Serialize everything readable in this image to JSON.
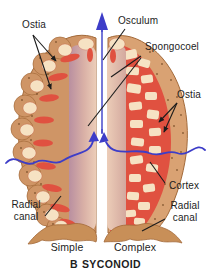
{
  "figure": {
    "labels": {
      "ostia_left": "Ostia",
      "osculum": "Osculum",
      "spongocoel": "Spongocoel",
      "ostia_right": "Ostia",
      "cortex": "Cortex",
      "radial_canal_left": "Radial canal",
      "radial_canal_right": "Radial canal",
      "simple": "Simple",
      "complex": "Complex"
    },
    "caption": {
      "letter": "B",
      "title": "SYCONOID"
    },
    "colors": {
      "tan_body": "#cf9566",
      "tan_light": "#d9a273",
      "tan_dark": "#a36a3a",
      "cream": "#f6e2c3",
      "canal_red": "#e05140",
      "red_dark": "#b93a2e",
      "inner_pink": "#e3c0af",
      "inner_mauve": "#b98fa0",
      "base_tan": "#c88f58",
      "arrow_blue": "#3d3dc8",
      "label_line": "#1c1c1c",
      "text": "#1d1d1d",
      "background": "#ffffff"
    }
  }
}
